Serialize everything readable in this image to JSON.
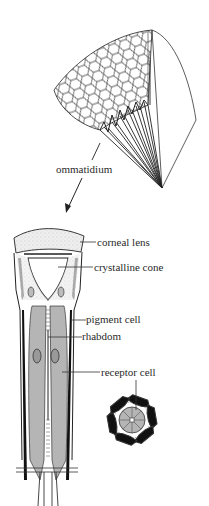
{
  "diagram": {
    "labels": {
      "ommatidium": "ommatidium",
      "corneal_lens": "corneal lens",
      "crystalline_cone": "crystalline cone",
      "pigment_cell": "pigment cell",
      "rhabdom": "rhabdom",
      "receptor_cell": "receptor cell"
    },
    "colors": {
      "line": "#1a1a1a",
      "receptor_fill": "#b5b5b5",
      "lens_fill": "#ededed",
      "pigment": "#111111",
      "background": "#ffffff"
    }
  }
}
